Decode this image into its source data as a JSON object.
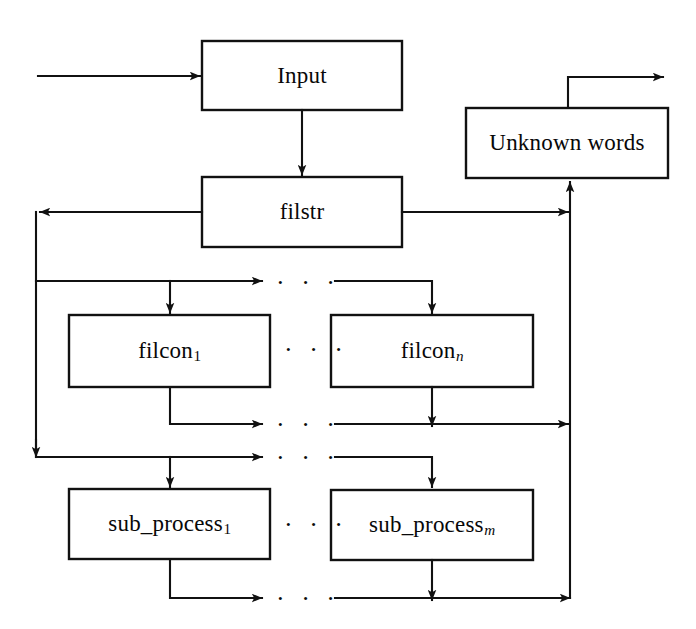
{
  "diagram": {
    "stroke_color": "#111111",
    "background_color": "#ffffff",
    "nodes": [
      {
        "id": "input",
        "label": "Input",
        "sub": "",
        "sub_italic": false,
        "x": 202,
        "y": 41,
        "w": 200,
        "h": 69
      },
      {
        "id": "unknown",
        "label": "Unknown words",
        "sub": "",
        "sub_italic": false,
        "x": 466,
        "y": 108,
        "w": 202,
        "h": 70
      },
      {
        "id": "filstr",
        "label": "filstr",
        "sub": "",
        "sub_italic": false,
        "x": 202,
        "y": 177,
        "w": 200,
        "h": 70
      },
      {
        "id": "filcon1",
        "label": "filcon",
        "sub": "1",
        "sub_italic": false,
        "x": 69,
        "y": 315,
        "w": 201,
        "h": 72
      },
      {
        "id": "filconn",
        "label": "filcon",
        "sub": "n",
        "sub_italic": true,
        "x": 331,
        "y": 315,
        "w": 202,
        "h": 72
      },
      {
        "id": "subprocess1",
        "label": "sub_process",
        "sub": "1",
        "sub_italic": false,
        "x": 69,
        "y": 489,
        "w": 201,
        "h": 70
      },
      {
        "id": "subprocessm",
        "label": "sub_process",
        "sub": "m",
        "sub_italic": true,
        "x": 331,
        "y": 490,
        "w": 202,
        "h": 70
      }
    ],
    "ellipses": [
      {
        "id": "ellipsis-filcon-in",
        "x": 276,
        "y": 270
      },
      {
        "id": "ellipsis-filcon-row",
        "x": 284,
        "y": 337
      },
      {
        "id": "ellipsis-filcon-out",
        "x": 276,
        "y": 412
      },
      {
        "id": "ellipsis-sub-in",
        "x": 276,
        "y": 445
      },
      {
        "id": "ellipsis-sub-row",
        "x": 284,
        "y": 512
      },
      {
        "id": "ellipsis-sub-out",
        "x": 276,
        "y": 586
      },
      {
        "dots": "..."
      }
    ],
    "ellipsis_glyph": "· · ·",
    "edges": [
      {
        "id": "external-in-to-input",
        "from": "external",
        "to": "input"
      },
      {
        "id": "input-to-filstr",
        "from": "input",
        "to": "filstr"
      },
      {
        "id": "filstr-to-right-bus",
        "from": "filstr",
        "to": "right-bus"
      },
      {
        "id": "filstr-to-left-bus",
        "from": "filstr",
        "to": "left-bus"
      },
      {
        "id": "left-bus-to-filcon-in-bus",
        "from": "left-bus",
        "to": "filcon-input-bus"
      },
      {
        "id": "filcon-in-bus-to-filcon1",
        "from": "filcon-input-bus",
        "to": "filcon1"
      },
      {
        "id": "filcon-in-bus-to-filconn",
        "from": "filcon-input-bus",
        "to": "filconn"
      },
      {
        "id": "filcon1-to-filcon-out-bus",
        "from": "filcon1",
        "to": "filcon-output-bus"
      },
      {
        "id": "filconn-to-filcon-out-bus",
        "from": "filconn",
        "to": "filcon-output-bus"
      },
      {
        "id": "filcon-out-bus-to-right-bus",
        "from": "filcon-output-bus",
        "to": "right-bus"
      },
      {
        "id": "left-bus-to-sub-in-bus",
        "from": "left-bus",
        "to": "subprocess-input-bus"
      },
      {
        "id": "sub-in-bus-to-subprocess1",
        "from": "subprocess-input-bus",
        "to": "subprocess1"
      },
      {
        "id": "sub-in-bus-to-subprocessm",
        "from": "subprocess-input-bus",
        "to": "subprocessm"
      },
      {
        "id": "subprocess1-to-sub-out-bus",
        "from": "subprocess1",
        "to": "subprocess-output-bus"
      },
      {
        "id": "subprocessm-to-sub-out-bus",
        "from": "subprocessm",
        "to": "subprocess-output-bus"
      },
      {
        "id": "sub-out-bus-to-right-bus",
        "from": "subprocess-output-bus",
        "to": "right-bus"
      },
      {
        "id": "right-bus-to-unknown-words",
        "from": "right-bus",
        "to": "unknown"
      },
      {
        "id": "unknown-words-to-external-out",
        "from": "unknown",
        "to": "external"
      }
    ]
  }
}
